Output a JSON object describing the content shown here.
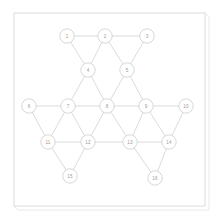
{
  "figure": {
    "background_color": "#ffffff",
    "frame": {
      "name": "outer-frame",
      "stroke_color": "#d8d8d8",
      "shadow_color": "#e4e4e4",
      "x": 14,
      "y": 13,
      "width": 191,
      "height": 193,
      "shadow_offset": 4
    }
  },
  "chart_data": {
    "type": "diagram",
    "subtype": "node-link-graph",
    "title": "",
    "xlabel": "",
    "ylabel": "",
    "grid": false,
    "legend": null,
    "node_style": {
      "radius": 7.2,
      "fill": "#ffffff",
      "stroke": "#c9c9c9",
      "label_color": "#9a9a9a"
    },
    "edge_style": {
      "stroke": "#cfcfcf",
      "width": 0.75
    },
    "node_count": 16,
    "edge_count": 30,
    "nodes": [
      {
        "id": 1,
        "label": "1",
        "x": 67,
        "y": 36
      },
      {
        "id": 2,
        "label": "2",
        "x": 105,
        "y": 36
      },
      {
        "id": 3,
        "label": "3",
        "x": 147,
        "y": 36
      },
      {
        "id": 4,
        "label": "4",
        "x": 88,
        "y": 70
      },
      {
        "id": 5,
        "label": "5",
        "x": 127,
        "y": 70
      },
      {
        "id": 6,
        "label": "6",
        "x": 29,
        "y": 106
      },
      {
        "id": 7,
        "label": "7",
        "x": 68,
        "y": 106
      },
      {
        "id": 8,
        "label": "8",
        "x": 107,
        "y": 106
      },
      {
        "id": 9,
        "label": "9",
        "x": 146,
        "y": 106
      },
      {
        "id": 10,
        "label": "10",
        "x": 186,
        "y": 106
      },
      {
        "id": 11,
        "label": "11",
        "x": 48,
        "y": 142
      },
      {
        "id": 12,
        "label": "12",
        "x": 88,
        "y": 142
      },
      {
        "id": 13,
        "label": "13",
        "x": 130,
        "y": 142
      },
      {
        "id": 14,
        "label": "14",
        "x": 169,
        "y": 142
      },
      {
        "id": 15,
        "label": "15",
        "x": 70,
        "y": 176
      },
      {
        "id": 16,
        "label": "16",
        "x": 155,
        "y": 178
      }
    ],
    "edges": [
      {
        "source": 1,
        "target": 2
      },
      {
        "source": 2,
        "target": 3
      },
      {
        "source": 1,
        "target": 4
      },
      {
        "source": 2,
        "target": 4
      },
      {
        "source": 2,
        "target": 5
      },
      {
        "source": 3,
        "target": 5
      },
      {
        "source": 4,
        "target": 7
      },
      {
        "source": 4,
        "target": 8
      },
      {
        "source": 5,
        "target": 8
      },
      {
        "source": 5,
        "target": 9
      },
      {
        "source": 6,
        "target": 7
      },
      {
        "source": 7,
        "target": 8
      },
      {
        "source": 8,
        "target": 9
      },
      {
        "source": 9,
        "target": 10
      },
      {
        "source": 6,
        "target": 11
      },
      {
        "source": 7,
        "target": 11
      },
      {
        "source": 7,
        "target": 12
      },
      {
        "source": 8,
        "target": 12
      },
      {
        "source": 8,
        "target": 13
      },
      {
        "source": 9,
        "target": 13
      },
      {
        "source": 9,
        "target": 14
      },
      {
        "source": 10,
        "target": 14
      },
      {
        "source": 11,
        "target": 12
      },
      {
        "source": 12,
        "target": 13
      },
      {
        "source": 13,
        "target": 14
      },
      {
        "source": 11,
        "target": 15
      },
      {
        "source": 12,
        "target": 15
      },
      {
        "source": 13,
        "target": 16
      },
      {
        "source": 14,
        "target": 16
      }
    ]
  }
}
